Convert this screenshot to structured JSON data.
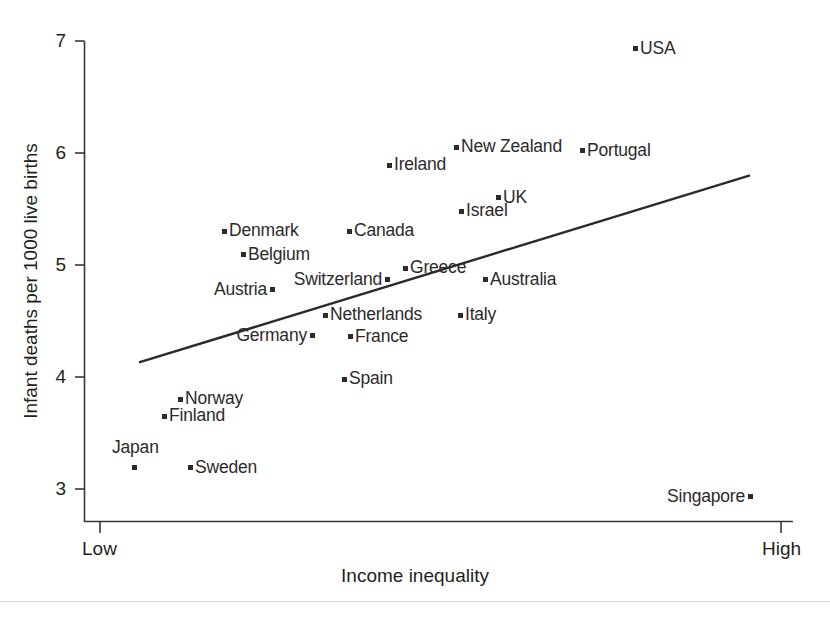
{
  "chart_data": {
    "type": "scatter",
    "title": "",
    "xlabel": "Income inequality",
    "ylabel": "Infant deaths per 1000 live births",
    "xtick_labels": [
      "Low",
      "High"
    ],
    "ytick_labels": [
      "3",
      "4",
      "5",
      "6",
      "7"
    ],
    "ylim": [
      2.85,
      7.15
    ],
    "xlim_labels": [
      "Low",
      "High"
    ],
    "grid": false,
    "legend": "none",
    "trendline": {
      "label": "regression line",
      "x_start_px": 139,
      "y_start_value": 4.13,
      "x_end_px": 750,
      "y_end_value": 5.8
    },
    "points": [
      {
        "name": "USA",
        "x_px": 635,
        "y_value": 6.93,
        "label_side": "right"
      },
      {
        "name": "New Zealand",
        "x_px": 456,
        "y_value": 6.05,
        "label_side": "right"
      },
      {
        "name": "Portugal",
        "x_px": 582,
        "y_value": 6.02,
        "label_side": "right"
      },
      {
        "name": "Ireland",
        "x_px": 389,
        "y_value": 5.89,
        "label_side": "right"
      },
      {
        "name": "UK",
        "x_px": 498,
        "y_value": 5.6,
        "label_side": "right"
      },
      {
        "name": "Israel",
        "x_px": 461,
        "y_value": 5.48,
        "label_side": "right"
      },
      {
        "name": "Denmark",
        "x_px": 224,
        "y_value": 5.3,
        "label_side": "right"
      },
      {
        "name": "Canada",
        "x_px": 349,
        "y_value": 5.3,
        "label_side": "right"
      },
      {
        "name": "Belgium",
        "x_px": 243,
        "y_value": 5.09,
        "label_side": "right"
      },
      {
        "name": "Greece",
        "x_px": 405,
        "y_value": 4.97,
        "label_side": "right"
      },
      {
        "name": "Australia",
        "x_px": 485,
        "y_value": 4.87,
        "label_side": "right"
      },
      {
        "name": "Switzerland",
        "x_px": 387,
        "y_value": 4.87,
        "label_side": "left"
      },
      {
        "name": "Austria",
        "x_px": 272,
        "y_value": 4.78,
        "label_side": "left"
      },
      {
        "name": "Netherlands",
        "x_px": 325,
        "y_value": 4.55,
        "label_side": "right"
      },
      {
        "name": "Italy",
        "x_px": 460,
        "y_value": 4.55,
        "label_side": "right"
      },
      {
        "name": "France",
        "x_px": 350,
        "y_value": 4.36,
        "label_side": "right"
      },
      {
        "name": "Germany",
        "x_px": 312,
        "y_value": 4.37,
        "label_side": "left"
      },
      {
        "name": "Spain",
        "x_px": 344,
        "y_value": 3.98,
        "label_side": "right"
      },
      {
        "name": "Norway",
        "x_px": 180,
        "y_value": 3.8,
        "label_side": "right"
      },
      {
        "name": "Finland",
        "x_px": 164,
        "y_value": 3.65,
        "label_side": "right"
      },
      {
        "name": "Japan",
        "x_px": 134,
        "y_value": 3.19,
        "label_side": "above"
      },
      {
        "name": "Sweden",
        "x_px": 190,
        "y_value": 3.19,
        "label_side": "right"
      },
      {
        "name": "Singapore",
        "x_px": 750,
        "y_value": 2.93,
        "label_side": "left"
      }
    ]
  },
  "colors": {
    "ink": "#231f20",
    "marker": "#2d2a2b",
    "axis": "#3a3536"
  }
}
